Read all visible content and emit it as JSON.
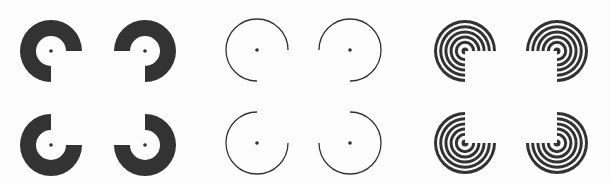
{
  "figure": {
    "width": 610,
    "height": 183,
    "background": "#fdfdfd",
    "ink": "#333333",
    "groups": [
      {
        "name": "solid-pacmen",
        "style": "solid-annulus",
        "outer_radius": 31,
        "inner_radius": 15,
        "dot_radius": 1.8,
        "inducers": [
          {
            "cx": 51,
            "cy": 51,
            "missing": "bottom-right"
          },
          {
            "cx": 145,
            "cy": 51,
            "missing": "bottom-left"
          },
          {
            "cx": 51,
            "cy": 145,
            "missing": "top-right"
          },
          {
            "cx": 145,
            "cy": 145,
            "missing": "top-left"
          }
        ]
      },
      {
        "name": "thin-arcs",
        "style": "thin-arc",
        "radius": 31,
        "stroke_width": 1.3,
        "dot_radius": 1.8,
        "inducers": [
          {
            "cx": 257,
            "cy": 50,
            "missing": "bottom-right"
          },
          {
            "cx": 350,
            "cy": 50,
            "missing": "bottom-left"
          },
          {
            "cx": 257,
            "cy": 143,
            "missing": "top-right"
          },
          {
            "cx": 350,
            "cy": 143,
            "missing": "top-left"
          }
        ]
      },
      {
        "name": "concentric-rings",
        "style": "concentric-rings",
        "outer_radius": 31,
        "ring_count": 6,
        "ring_width": 3,
        "ring_pitch": 5.2,
        "core_radius": 3.5,
        "inducers": [
          {
            "cx": 465,
            "cy": 51,
            "missing": "bottom-right"
          },
          {
            "cx": 557,
            "cy": 51,
            "missing": "bottom-left"
          },
          {
            "cx": 465,
            "cy": 143,
            "missing": "top-right"
          },
          {
            "cx": 557,
            "cy": 143,
            "missing": "top-left"
          }
        ]
      }
    ]
  }
}
